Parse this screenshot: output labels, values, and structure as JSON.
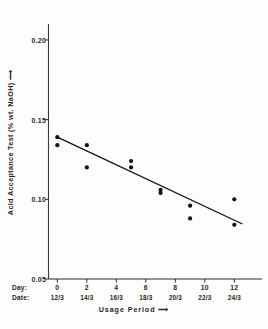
{
  "chart_data": {
    "type": "scatter",
    "title": "",
    "ylabel": "Acid Acceptance Test (% wt. NaOH) ⟶",
    "xlabel": "Usage Period ⟶",
    "xlim": [
      -0.6,
      13.2
    ],
    "ylim": [
      0.05,
      0.205
    ],
    "grid": false,
    "legend": null,
    "x_axis": {
      "day_key": "Day:",
      "date_key": "Date:",
      "day_ticks": [
        "0",
        "2",
        "4",
        "6",
        "8",
        "10",
        "12"
      ],
      "day_values": [
        0,
        2,
        4,
        6,
        8,
        10,
        12
      ],
      "date_ticks": [
        "12/3",
        "14/3",
        "16/3",
        "18/3",
        "20/3",
        "22/3",
        "24/3"
      ]
    },
    "y_axis": {
      "ticks": [
        0.05,
        0.1,
        0.15,
        0.2
      ],
      "tick_labels": [
        "0.05",
        "0.10",
        "0.15",
        "0.20"
      ]
    },
    "series": [
      {
        "name": "Acid acceptance measurements",
        "marker": "filled-circle",
        "color": "#111111",
        "points": [
          {
            "x": 0,
            "y": 0.139
          },
          {
            "x": 0,
            "y": 0.134
          },
          {
            "x": 2,
            "y": 0.134
          },
          {
            "x": 2,
            "y": 0.12
          },
          {
            "x": 5,
            "y": 0.124
          },
          {
            "x": 5,
            "y": 0.12
          },
          {
            "x": 7,
            "y": 0.106
          },
          {
            "x": 7,
            "y": 0.104
          },
          {
            "x": 9,
            "y": 0.096
          },
          {
            "x": 9,
            "y": 0.088
          },
          {
            "x": 12,
            "y": 0.1
          },
          {
            "x": 12,
            "y": 0.084
          }
        ]
      }
    ],
    "trend_line": {
      "name": "fitted regression line",
      "color": "#111111",
      "x_start": 0,
      "y_start": 0.139,
      "x_end": 12.55,
      "y_end": 0.0845
    }
  }
}
